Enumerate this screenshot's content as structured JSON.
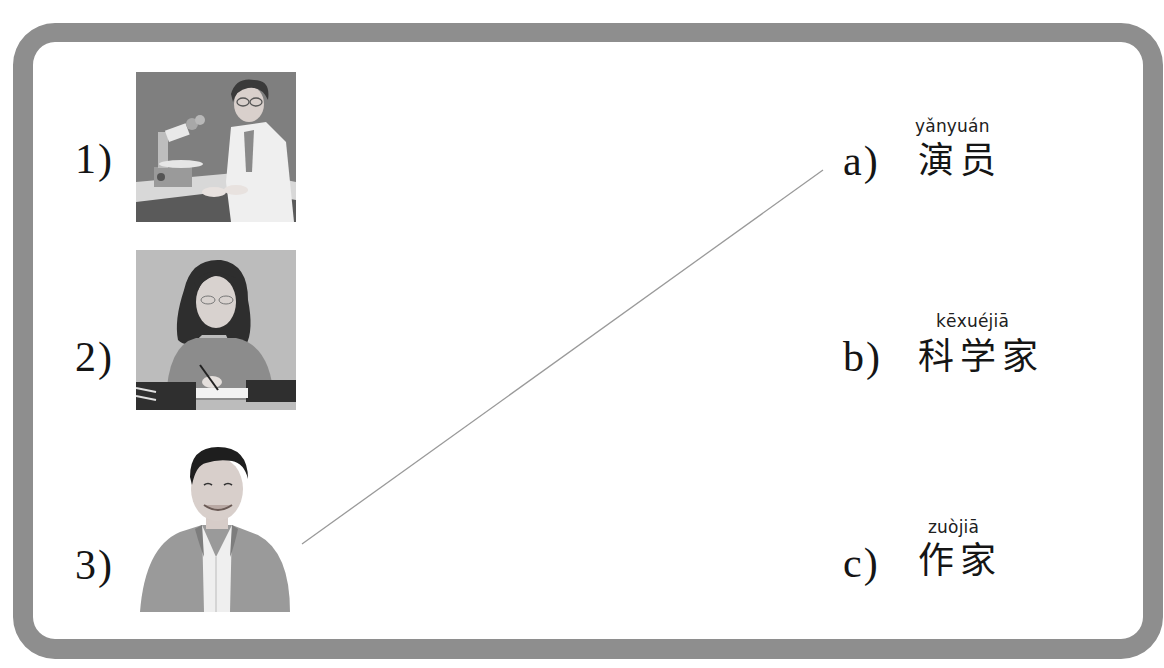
{
  "exercise": {
    "frame_color": "#8e8e8e",
    "pictures": [
      {
        "number": "1)",
        "subject": "scientist at microscope",
        "icon": "scientist-illustration"
      },
      {
        "number": "2)",
        "subject": "woman writing at desk",
        "icon": "writer-illustration"
      },
      {
        "number": "3)",
        "subject": "smiling man in jacket",
        "icon": "actor-illustration"
      }
    ],
    "options": [
      {
        "letter": "a)",
        "pinyin": "yǎnyuán",
        "hanzi": "演员"
      },
      {
        "letter": "b)",
        "pinyin": "kēxuéjiā",
        "hanzi": "科学家"
      },
      {
        "letter": "c)",
        "pinyin": "zuòjiā",
        "hanzi": "作家"
      }
    ],
    "matches": [
      {
        "from": "3)",
        "to": "a)",
        "line_color": "#9a9a9a"
      }
    ]
  }
}
